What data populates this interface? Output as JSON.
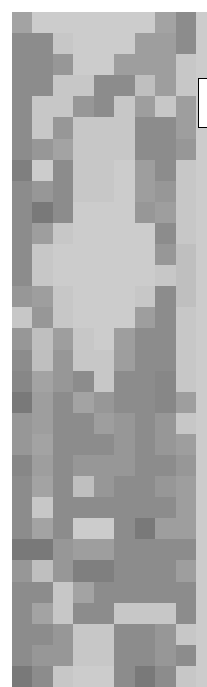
{
  "figure": {
    "title": "",
    "background_color": "#ffffff",
    "plot_background_color": "#cfcfcf"
  },
  "legend": {
    "visible": true,
    "label": "",
    "border_color": "#000000",
    "background_color": "#ffffff"
  },
  "chart_data": {
    "type": "heatmap",
    "title": "",
    "subtitle": "",
    "xlabel": "",
    "ylabel": "",
    "grid": false,
    "legend_position": "right",
    "colormap": "grayscale",
    "cell_size_px": 21,
    "n_cols": 9,
    "n_rows": 32,
    "x_tick_labels": [],
    "y_tick_labels": [],
    "vmin": 0.0,
    "vmax": 1.0,
    "color_scale": [
      {
        "value": 0.0,
        "hex": "#565656"
      },
      {
        "value": 0.2,
        "hex": "#6e6e6e"
      },
      {
        "value": 0.4,
        "hex": "#8a8a8a"
      },
      {
        "value": 0.6,
        "hex": "#a0a0a0"
      },
      {
        "value": 0.8,
        "hex": "#bfbfbf"
      },
      {
        "value": 1.0,
        "hex": "#d4d4d4"
      }
    ],
    "values": [
      [
        0.62,
        0.92,
        0.92,
        0.92,
        0.92,
        0.92,
        0.92,
        0.62,
        0.42
      ],
      [
        0.42,
        0.42,
        0.88,
        0.92,
        0.92,
        0.92,
        0.58,
        0.58,
        0.42
      ],
      [
        0.42,
        0.42,
        0.52,
        0.92,
        0.92,
        0.58,
        0.58,
        0.58,
        0.88
      ],
      [
        0.42,
        0.42,
        0.88,
        0.88,
        0.42,
        0.42,
        0.8,
        0.58,
        0.88
      ],
      [
        0.42,
        0.88,
        0.88,
        0.52,
        0.42,
        0.88,
        0.58,
        0.88,
        0.58
      ],
      [
        0.42,
        0.88,
        0.52,
        0.88,
        0.88,
        0.88,
        0.42,
        0.42,
        0.58
      ],
      [
        0.42,
        0.52,
        0.62,
        0.88,
        0.88,
        0.88,
        0.42,
        0.42,
        0.52
      ],
      [
        0.32,
        0.92,
        0.42,
        0.88,
        0.88,
        0.92,
        0.58,
        0.42,
        0.88
      ],
      [
        0.42,
        0.52,
        0.42,
        0.88,
        0.88,
        0.92,
        0.58,
        0.52,
        0.88
      ],
      [
        0.42,
        0.28,
        0.42,
        0.92,
        0.92,
        0.92,
        0.52,
        0.58,
        0.88
      ],
      [
        0.42,
        0.58,
        0.88,
        0.92,
        0.92,
        0.92,
        0.92,
        0.42,
        0.88
      ],
      [
        0.42,
        0.88,
        0.92,
        0.92,
        0.92,
        0.92,
        0.92,
        0.52,
        0.8
      ],
      [
        0.42,
        0.88,
        0.92,
        0.92,
        0.92,
        0.92,
        0.92,
        0.88,
        0.8
      ],
      [
        0.52,
        0.58,
        0.88,
        0.92,
        0.92,
        0.92,
        0.88,
        0.42,
        0.8
      ],
      [
        0.88,
        0.52,
        0.88,
        0.92,
        0.92,
        0.92,
        0.58,
        0.42,
        0.88
      ],
      [
        0.52,
        0.8,
        0.58,
        0.88,
        0.92,
        0.58,
        0.42,
        0.42,
        0.88
      ],
      [
        0.42,
        0.8,
        0.52,
        0.88,
        0.88,
        0.58,
        0.42,
        0.42,
        0.88
      ],
      [
        0.38,
        0.62,
        0.52,
        0.42,
        0.88,
        0.42,
        0.42,
        0.38,
        0.88
      ],
      [
        0.28,
        0.58,
        0.42,
        0.62,
        0.52,
        0.42,
        0.42,
        0.38,
        0.58
      ],
      [
        0.52,
        0.58,
        0.42,
        0.42,
        0.58,
        0.52,
        0.42,
        0.52,
        0.88
      ],
      [
        0.52,
        0.62,
        0.42,
        0.42,
        0.42,
        0.52,
        0.42,
        0.52,
        0.58
      ],
      [
        0.38,
        0.58,
        0.42,
        0.52,
        0.52,
        0.52,
        0.42,
        0.42,
        0.52
      ],
      [
        0.42,
        0.62,
        0.42,
        0.8,
        0.52,
        0.42,
        0.42,
        0.52,
        0.58
      ],
      [
        0.42,
        0.88,
        0.42,
        0.42,
        0.42,
        0.42,
        0.42,
        0.42,
        0.58
      ],
      [
        0.42,
        0.62,
        0.42,
        0.92,
        0.92,
        0.42,
        0.28,
        0.58,
        0.58
      ],
      [
        0.28,
        0.28,
        0.52,
        0.58,
        0.58,
        0.42,
        0.42,
        0.42,
        0.42
      ],
      [
        0.52,
        0.8,
        0.52,
        0.32,
        0.32,
        0.42,
        0.42,
        0.42,
        0.58
      ],
      [
        0.42,
        0.42,
        0.88,
        0.62,
        0.42,
        0.42,
        0.42,
        0.42,
        0.42
      ],
      [
        0.42,
        0.62,
        0.88,
        0.42,
        0.42,
        0.88,
        0.88,
        0.88,
        0.42
      ],
      [
        0.42,
        0.42,
        0.52,
        0.88,
        0.88,
        0.42,
        0.42,
        0.52,
        0.88
      ],
      [
        0.42,
        0.52,
        0.52,
        0.88,
        0.88,
        0.42,
        0.42,
        0.52,
        0.42
      ],
      [
        0.28,
        0.42,
        0.88,
        0.92,
        0.92,
        0.42,
        0.28,
        0.42,
        0.88
      ]
    ]
  }
}
